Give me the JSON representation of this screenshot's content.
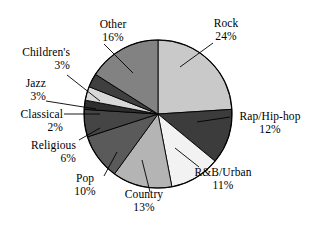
{
  "chart_data": {
    "type": "pie",
    "title": "",
    "subtitle": "",
    "xlabel": "",
    "ylabel": "",
    "legend_position": "none",
    "grid": false,
    "units": "percent",
    "value_suffix": "%",
    "categories": [
      "Rock",
      "Rap/Hip-hop",
      "R&B/Urban",
      "Country",
      "Pop",
      "Religious",
      "Classical",
      "Jazz",
      "Children's",
      "Other"
    ],
    "values": [
      24,
      12,
      11,
      13,
      10,
      6,
      2,
      3,
      3,
      16
    ],
    "slices": [
      {
        "label": "Rock",
        "value": 24,
        "value_text": "24%",
        "color": "#c9c9c9",
        "start_angle": 0,
        "end_angle": 86.4
      },
      {
        "label": "Rap/Hip-hop",
        "value": 12,
        "value_text": "12%",
        "color": "#3c3c3c",
        "start_angle": 86.4,
        "end_angle": 129.6
      },
      {
        "label": "R&B/Urban",
        "value": 11,
        "value_text": "11%",
        "color": "#f2f2f2",
        "start_angle": 129.6,
        "end_angle": 169.2
      },
      {
        "label": "Country",
        "value": 13,
        "value_text": "13%",
        "color": "#b4b4b4",
        "start_angle": 169.2,
        "end_angle": 216.0
      },
      {
        "label": "Pop",
        "value": 10,
        "value_text": "10%",
        "color": "#5a5a5a",
        "start_angle": 216.0,
        "end_angle": 252.0
      },
      {
        "label": "Religious",
        "value": 6,
        "value_text": "6%",
        "color": "#454545",
        "start_angle": 252.0,
        "end_angle": 273.6
      },
      {
        "label": "Classical",
        "value": 2,
        "value_text": "2%",
        "color": "#2e2e2e",
        "start_angle": 273.6,
        "end_angle": 280.8
      },
      {
        "label": "Jazz",
        "value": 3,
        "value_text": "3%",
        "color": "#d8d8d8",
        "start_angle": 280.8,
        "end_angle": 291.6
      },
      {
        "label": "Children's",
        "value": 3,
        "value_text": "3%",
        "color": "#3f3f3f",
        "start_angle": 291.6,
        "end_angle": 302.4
      },
      {
        "label": "Other",
        "value": 16,
        "value_text": "16%",
        "color": "#828282",
        "start_angle": 302.4,
        "end_angle": 360.0
      }
    ],
    "geometry": {
      "center_x": 158,
      "center_y": 114,
      "radius": 74,
      "outline_color": "#000000"
    }
  },
  "labels": {
    "rock": {
      "name": "Rock",
      "value": "24%"
    },
    "rap": {
      "name": "Rap/Hip-hop",
      "value": "12%"
    },
    "rnb": {
      "name": "R&B/Urban",
      "value": "11%"
    },
    "country": {
      "name": "Country",
      "value": "13%"
    },
    "pop": {
      "name": "Pop",
      "value": "10%"
    },
    "religious": {
      "name": "Religious",
      "value": "6%"
    },
    "classical": {
      "name": "Classical",
      "value": "2%"
    },
    "jazz": {
      "name": "Jazz",
      "value": "3%"
    },
    "childrens": {
      "name": "Children's",
      "value": "3%"
    },
    "other": {
      "name": "Other",
      "value": "16%"
    }
  }
}
